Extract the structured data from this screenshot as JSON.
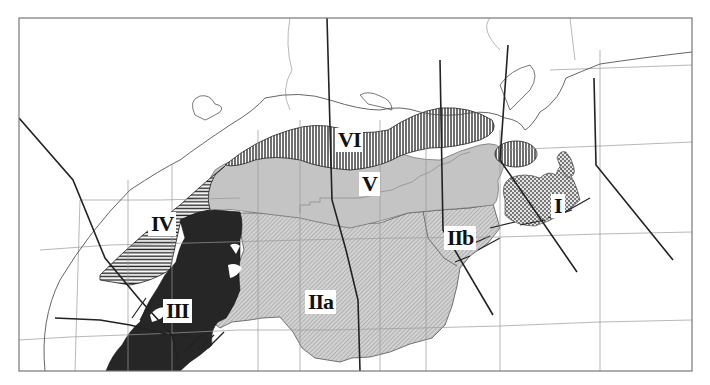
{
  "map": {
    "title": "",
    "frame": {
      "x": 19,
      "y": 18,
      "width": 673,
      "height": 353
    },
    "colors": {
      "background": "#ffffff",
      "frame": "#777777",
      "boundary_thin": "#9a9a9a",
      "coastline": "#555555",
      "thick_line": "#222222",
      "zone_V_fill": "#c4c4c4",
      "zone_II_fill": "#cfcfcf",
      "zone_III_fill": "#262626",
      "hatch_dark": "#222222",
      "label_bg": "#ffffff",
      "label_text": "#111111"
    },
    "zones": [
      {
        "id": "I",
        "label": "I",
        "pattern": "dotted-stipple",
        "label_pos": {
          "x": 551,
          "y": 201
        }
      },
      {
        "id": "IIa",
        "label": "IIa",
        "pattern": "diagonal-hatch-gray",
        "label_pos": {
          "x": 306,
          "y": 283
        }
      },
      {
        "id": "IIb",
        "label": "IIb",
        "pattern": "diagonal-hatch-gray",
        "label_pos": {
          "x": 444,
          "y": 225
        }
      },
      {
        "id": "III",
        "label": "III",
        "pattern": "solid-black",
        "label_pos": {
          "x": 164,
          "y": 296
        }
      },
      {
        "id": "IV",
        "label": "IV",
        "pattern": "horizontal-lines",
        "label_pos": {
          "x": 148,
          "y": 222
        }
      },
      {
        "id": "V",
        "label": "V",
        "pattern": "solid-gray",
        "label_pos": {
          "x": 359,
          "y": 180
        }
      },
      {
        "id": "VI",
        "label": "VI",
        "pattern": "vertical-lines",
        "label_pos": {
          "x": 335,
          "y": 140
        }
      }
    ]
  }
}
